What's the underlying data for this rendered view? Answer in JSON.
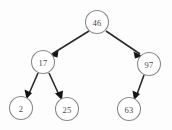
{
  "figure": {
    "type": "binary-tree-diagram",
    "background_color": "#fdfdfd",
    "node_stroke_color": "#8a8a8a",
    "node_fill_color": "#ffffff",
    "label_color": "#4a4a4a",
    "edge_color": "#2b2b2b",
    "arrow_color": "#141414",
    "width": 172,
    "height": 130
  },
  "nodes": [
    {
      "id": "root",
      "label": "46",
      "cx": 97,
      "cy": 22,
      "r": 11.5
    },
    {
      "id": "left",
      "label": "17",
      "cx": 43,
      "cy": 62,
      "r": 11.5
    },
    {
      "id": "right",
      "label": "97",
      "cx": 149,
      "cy": 64,
      "r": 11.5
    },
    {
      "id": "left-left",
      "label": "2",
      "cx": 21,
      "cy": 108,
      "r": 11.5
    },
    {
      "id": "left-right",
      "label": "25",
      "cx": 67,
      "cy": 109,
      "r": 11.5
    },
    {
      "id": "right-left",
      "label": "63",
      "cx": 129,
      "cy": 109,
      "r": 11.5
    }
  ],
  "edges": [
    {
      "id": "edge-46-17",
      "from": "46",
      "to": "17",
      "x1": 89,
      "y1": 31,
      "x2": 50,
      "y2": 55
    },
    {
      "id": "edge-46-97",
      "from": "46",
      "to": "97",
      "x1": 106,
      "y1": 31,
      "x2": 142,
      "y2": 56
    },
    {
      "id": "edge-17-2",
      "from": "17",
      "to": "2",
      "x1": 38,
      "y1": 73,
      "x2": 26,
      "y2": 98
    },
    {
      "id": "edge-17-25",
      "from": "17",
      "to": "25",
      "x1": 49,
      "y1": 73,
      "x2": 62,
      "y2": 99
    },
    {
      "id": "edge-97-63",
      "from": "97",
      "to": "63",
      "x1": 144,
      "y1": 75,
      "x2": 134,
      "y2": 99
    }
  ]
}
